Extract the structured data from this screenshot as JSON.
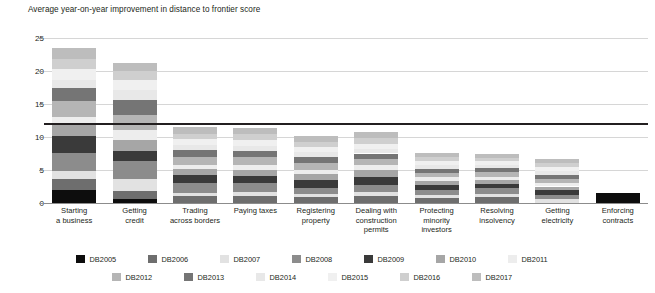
{
  "title": "Average year-on-year improvement in distance to frontier score",
  "legend": {
    "rows": [
      [
        "DB2005",
        "DB2006",
        "DB2007",
        "DB2008",
        "DB2009",
        "DB2010",
        "DB2011"
      ],
      [
        "DB2012",
        "DB2013",
        "DB2014",
        "DB2015",
        "DB2016",
        "DB2017"
      ]
    ]
  },
  "series_colors": {
    "DB2005": "#0d0d0d",
    "DB2006": "#6e6e6e",
    "DB2007": "#e2e2e2",
    "DB2008": "#8c8c8c",
    "DB2009": "#3a3a3a",
    "DB2010": "#a6a6a6",
    "DB2011": "#ededed",
    "DB2012": "#b5b5b5",
    "DB2013": "#757575",
    "DB2014": "#e8e8e8",
    "DB2015": "#f0f0f0",
    "DB2016": "#cfcfcf",
    "DB2017": "#bdbdbd"
  },
  "chart_data": {
    "type": "bar",
    "subtype": "stacked-column",
    "title": "Average year-on-year improvement in distance to frontier score",
    "xlabel": "",
    "ylabel": "",
    "ylim": [
      0,
      25
    ],
    "yticks": [
      0,
      5,
      10,
      15,
      20,
      25
    ],
    "grid": true,
    "legend_position": "bottom",
    "categories": [
      "Starting a business",
      "Getting credit",
      "Trading across borders",
      "Paying taxes",
      "Registering property",
      "Dealing with construction permits",
      "Protecting minority investors",
      "Resolving insolvency",
      "Getting electricity",
      "Enforcing contracts"
    ],
    "category_lines": [
      [
        "Starting",
        "a business"
      ],
      [
        "Getting",
        "credit"
      ],
      [
        "Trading",
        "across borders"
      ],
      [
        "Paying taxes"
      ],
      [
        "Registering",
        "property"
      ],
      [
        "Dealing with",
        "construction",
        "permits"
      ],
      [
        "Protecting",
        "minority",
        "investors"
      ],
      [
        "Resolving",
        "insolvency"
      ],
      [
        "Getting",
        "electricity"
      ],
      [
        "Enforcing",
        "contracts"
      ]
    ],
    "series": [
      {
        "name": "DB2005",
        "values": [
          2.0,
          0.6,
          0.0,
          0.0,
          0.0,
          0.0,
          0.0,
          0.0,
          0.0,
          1.5
        ]
      },
      {
        "name": "DB2006",
        "values": [
          1.6,
          1.2,
          1.0,
          1.1,
          0.9,
          1.0,
          0.7,
          0.9,
          0.0,
          0.0
        ]
      },
      {
        "name": "DB2007",
        "values": [
          1.3,
          1.9,
          0.5,
          0.6,
          0.5,
          0.6,
          0.5,
          0.5,
          0.6,
          0.0
        ]
      },
      {
        "name": "DB2008",
        "values": [
          2.7,
          2.6,
          1.6,
          1.3,
          0.9,
          1.1,
          0.8,
          0.8,
          0.6,
          0.0
        ]
      },
      {
        "name": "DB2009",
        "values": [
          2.6,
          1.6,
          1.2,
          1.1,
          1.2,
          1.3,
          0.8,
          0.7,
          0.7,
          0.0
        ]
      },
      {
        "name": "DB2010",
        "values": [
          1.9,
          1.7,
          0.9,
          0.9,
          0.9,
          1.0,
          0.6,
          0.6,
          0.6,
          0.0
        ]
      },
      {
        "name": "DB2011",
        "values": [
          1.0,
          1.4,
          0.6,
          0.7,
          0.6,
          0.7,
          0.5,
          0.5,
          0.5,
          0.0
        ]
      },
      {
        "name": "DB2012",
        "values": [
          2.4,
          2.4,
          1.2,
          1.2,
          1.1,
          1.0,
          0.7,
          0.7,
          0.7,
          0.0
        ]
      },
      {
        "name": "DB2013",
        "values": [
          1.9,
          2.2,
          1.0,
          1.0,
          0.9,
          0.8,
          0.6,
          0.6,
          0.6,
          0.0
        ]
      },
      {
        "name": "DB2014",
        "values": [
          1.3,
          1.5,
          0.8,
          0.8,
          0.7,
          0.7,
          0.5,
          0.5,
          0.5,
          0.0
        ]
      },
      {
        "name": "DB2015",
        "values": [
          1.6,
          1.6,
          0.9,
          0.9,
          0.8,
          0.8,
          0.6,
          0.5,
          0.6,
          0.0
        ]
      },
      {
        "name": "DB2016",
        "values": [
          1.5,
          1.3,
          0.8,
          0.8,
          0.8,
          0.8,
          0.6,
          0.5,
          0.6,
          0.0
        ]
      },
      {
        "name": "DB2017",
        "values": [
          1.7,
          1.2,
          1.0,
          0.9,
          0.9,
          0.9,
          0.7,
          0.6,
          0.7,
          0.0
        ]
      }
    ],
    "totals": [
      23.5,
      21.2,
      11.5,
      11.3,
      10.2,
      10.7,
      7.6,
      7.4,
      6.7,
      1.5
    ],
    "reference_line": {
      "label": "",
      "value": 12.0,
      "color": "#231f20"
    }
  }
}
